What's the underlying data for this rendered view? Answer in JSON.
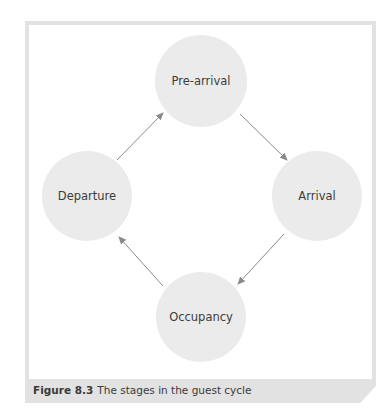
{
  "figure": {
    "caption_label": "Figure 8.3",
    "caption_text": "The stages in the guest cycle"
  },
  "nodes": [
    {
      "id": "pre-arrival",
      "label": "Pre-arrival",
      "cx": 201,
      "cy": 81
    },
    {
      "id": "arrival",
      "label": "Arrival",
      "cx": 317,
      "cy": 196
    },
    {
      "id": "occupancy",
      "label": "Occupancy",
      "cx": 201,
      "cy": 317
    },
    {
      "id": "departure",
      "label": "Departure",
      "cx": 87,
      "cy": 196
    }
  ],
  "edges": [
    {
      "from": "Pre-arrival",
      "to": "Arrival"
    },
    {
      "from": "Arrival",
      "to": "Occupancy"
    },
    {
      "from": "Occupancy",
      "to": "Departure"
    },
    {
      "from": "Departure",
      "to": "Pre-arrival"
    }
  ],
  "colors": {
    "node_fill": "#ebebeb",
    "arrow": "#8a8a8a",
    "frame": "#e2e2e2",
    "text": "#3c3c3c"
  }
}
